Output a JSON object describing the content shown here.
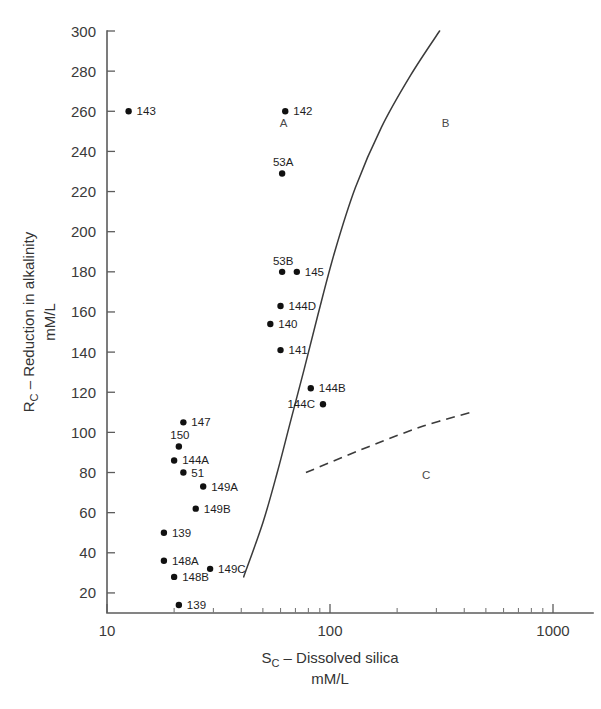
{
  "chart_data": {
    "type": "scatter",
    "title": "",
    "xlabel": "S_C – Dissolved silica",
    "xlabel_main": "S",
    "xlabel_sub": "C",
    "xlabel_rest": " – Dissolved silica",
    "xlabel_units": "mM/L",
    "ylabel_main": "R",
    "ylabel_sub": "C",
    "ylabel_rest": " – Reduction in alkalinity",
    "ylabel_units": "mM/L",
    "xscale": "log",
    "yscale": "linear",
    "xlim": [
      10,
      1000
    ],
    "ylim": [
      10,
      300
    ],
    "grid": false,
    "legend": false,
    "xticks": [
      10,
      100,
      1000
    ],
    "xtick_labels": [
      "10",
      "100",
      "1000"
    ],
    "yticks": [
      20,
      40,
      60,
      80,
      100,
      120,
      140,
      160,
      180,
      200,
      220,
      240,
      260,
      280,
      300
    ],
    "ytick_labels": [
      "20",
      "40",
      "60",
      "80",
      "100",
      "120",
      "140",
      "160",
      "180",
      "200",
      "220",
      "240",
      "260",
      "280",
      "300"
    ],
    "points": [
      {
        "label": "143",
        "x": 12.5,
        "y": 260,
        "label_pos": "right"
      },
      {
        "label": "142",
        "x": 63,
        "y": 260,
        "label_pos": "right"
      },
      {
        "label": "53A",
        "x": 61,
        "y": 229,
        "label_pos": "above"
      },
      {
        "label": "53B",
        "x": 61,
        "y": 180,
        "label_pos": "above"
      },
      {
        "label": "145",
        "x": 71,
        "y": 180,
        "label_pos": "right"
      },
      {
        "label": "144D",
        "x": 60,
        "y": 163,
        "label_pos": "right"
      },
      {
        "label": "140",
        "x": 54,
        "y": 154,
        "label_pos": "right"
      },
      {
        "label": "141",
        "x": 60,
        "y": 141,
        "label_pos": "right"
      },
      {
        "label": "144B",
        "x": 82,
        "y": 122,
        "label_pos": "right"
      },
      {
        "label": "144C",
        "x": 93,
        "y": 114,
        "label_pos": "left"
      },
      {
        "label": "147",
        "x": 22,
        "y": 105,
        "label_pos": "right"
      },
      {
        "label": "150",
        "x": 21,
        "y": 93,
        "label_pos": "above"
      },
      {
        "label": "144A",
        "x": 20,
        "y": 86,
        "label_pos": "right"
      },
      {
        "label": "51",
        "x": 22,
        "y": 80,
        "label_pos": "right"
      },
      {
        "label": "149A",
        "x": 27,
        "y": 73,
        "label_pos": "right"
      },
      {
        "label": "149B",
        "x": 25,
        "y": 62,
        "label_pos": "right"
      },
      {
        "label": "139",
        "x": 18,
        "y": 50,
        "label_pos": "right"
      },
      {
        "label": "148A",
        "x": 18,
        "y": 36,
        "label_pos": "right"
      },
      {
        "label": "149C",
        "x": 29,
        "y": 32,
        "label_pos": "right"
      },
      {
        "label": "148B",
        "x": 20,
        "y": 28,
        "label_pos": "right"
      },
      {
        "label": "139",
        "x": 21,
        "y": 14,
        "label_pos": "right"
      }
    ],
    "region_labels": [
      {
        "label": "A",
        "x": 62,
        "y": 252
      },
      {
        "label": "B",
        "x": 330,
        "y": 252
      },
      {
        "label": "C",
        "x": 270,
        "y": 77
      }
    ],
    "curves": [
      {
        "name": "boundary-AB",
        "style": "solid",
        "points": [
          {
            "x": 41,
            "y": 28
          },
          {
            "x": 50,
            "y": 55
          },
          {
            "x": 58,
            "y": 80
          },
          {
            "x": 66,
            "y": 104
          },
          {
            "x": 76,
            "y": 130
          },
          {
            "x": 88,
            "y": 158
          },
          {
            "x": 105,
            "y": 190
          },
          {
            "x": 130,
            "y": 222
          },
          {
            "x": 170,
            "y": 252
          },
          {
            "x": 230,
            "y": 278
          },
          {
            "x": 310,
            "y": 300
          }
        ]
      },
      {
        "name": "boundary-BC",
        "style": "dashed",
        "points": [
          {
            "x": 78,
            "y": 80
          },
          {
            "x": 150,
            "y": 93
          },
          {
            "x": 260,
            "y": 103
          },
          {
            "x": 430,
            "y": 110
          }
        ]
      }
    ]
  }
}
